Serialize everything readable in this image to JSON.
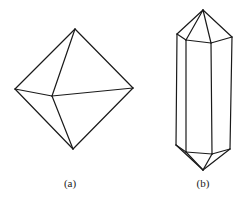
{
  "figures": [
    {
      "id": "a",
      "label": "(a)",
      "shape": "octahedron",
      "label_pos": [
        70,
        177
      ],
      "edges": [
        [
          [
            75,
            29
          ],
          [
            15,
            89
          ]
        ],
        [
          [
            75,
            29
          ],
          [
            133,
            88
          ]
        ],
        [
          [
            75,
            29
          ],
          [
            52,
            96
          ]
        ],
        [
          [
            15,
            89
          ],
          [
            52,
            96
          ]
        ],
        [
          [
            52,
            96
          ],
          [
            133,
            88
          ]
        ],
        [
          [
            15,
            89
          ],
          [
            73,
            149
          ]
        ],
        [
          [
            133,
            88
          ],
          [
            73,
            149
          ]
        ],
        [
          [
            52,
            96
          ],
          [
            73,
            149
          ]
        ]
      ]
    },
    {
      "id": "b",
      "label": "(b)",
      "shape": "hexagonal-prism-crystal",
      "label_pos": [
        203,
        177
      ],
      "edges": [
        [
          [
            203,
            10
          ],
          [
            177,
            34
          ]
        ],
        [
          [
            203,
            10
          ],
          [
            186,
            40
          ]
        ],
        [
          [
            203,
            10
          ],
          [
            211,
            43
          ]
        ],
        [
          [
            203,
            10
          ],
          [
            232,
            37
          ]
        ],
        [
          [
            177,
            34
          ],
          [
            186,
            40
          ]
        ],
        [
          [
            186,
            40
          ],
          [
            211,
            43
          ]
        ],
        [
          [
            211,
            43
          ],
          [
            232,
            37
          ]
        ],
        [
          [
            177,
            34
          ],
          [
            176,
            145
          ]
        ],
        [
          [
            186,
            40
          ],
          [
            186,
            152
          ]
        ],
        [
          [
            211,
            43
          ],
          [
            212,
            154
          ]
        ],
        [
          [
            232,
            37
          ],
          [
            230,
            149
          ]
        ],
        [
          [
            176,
            145
          ],
          [
            186,
            152
          ]
        ],
        [
          [
            186,
            152
          ],
          [
            212,
            154
          ]
        ],
        [
          [
            212,
            154
          ],
          [
            230,
            149
          ]
        ],
        [
          [
            176,
            145
          ],
          [
            203,
            170
          ]
        ],
        [
          [
            186,
            152
          ],
          [
            203,
            170
          ]
        ],
        [
          [
            212,
            154
          ],
          [
            203,
            170
          ]
        ],
        [
          [
            230,
            149
          ],
          [
            203,
            170
          ]
        ]
      ]
    }
  ],
  "stroke_color": "#1a1a1a"
}
